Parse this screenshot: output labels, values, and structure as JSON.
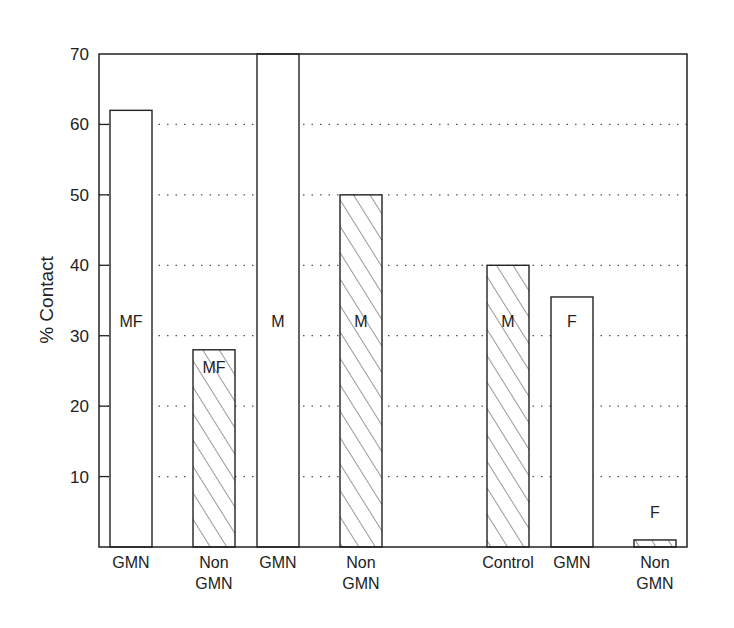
{
  "chart_data": {
    "type": "bar",
    "title": "",
    "xlabel": "",
    "ylabel": "% Contact",
    "ylim": [
      0,
      70
    ],
    "yticks": [
      10,
      20,
      30,
      40,
      50,
      60,
      70
    ],
    "grid": "horizontal dotted",
    "legend": "none (patterns: open = GMN, hatched = Non-GMN/Control; in-bar letters denote group)",
    "categories": [
      "GMN",
      "Non GMN",
      "GMN",
      "Non GMN",
      "Control",
      "GMN",
      "Non GMN"
    ],
    "values": [
      62,
      28,
      70,
      50,
      40,
      35.5,
      1
    ],
    "bars": [
      {
        "category": "GMN",
        "label": "MF",
        "value": 62,
        "pattern": "open"
      },
      {
        "category": "Non GMN",
        "label": "MF",
        "value": 28,
        "pattern": "hatched"
      },
      {
        "category": "GMN",
        "label": "M",
        "value": 70,
        "pattern": "open"
      },
      {
        "category": "Non GMN",
        "label": "M",
        "value": 50,
        "pattern": "hatched"
      },
      {
        "category": "Control",
        "label": "M",
        "value": 40,
        "pattern": "hatched"
      },
      {
        "category": "GMN",
        "label": "F",
        "value": 35.5,
        "pattern": "open"
      },
      {
        "category": "Non GMN",
        "label": "F",
        "value": 1,
        "pattern": "hatched"
      }
    ]
  },
  "axis": {
    "ylabel": "% Contact",
    "ytick_labels": [
      "10",
      "20",
      "30",
      "40",
      "50",
      "60",
      "70"
    ],
    "xtick_labels": [
      {
        "line1": "GMN",
        "line2": ""
      },
      {
        "line1": "Non",
        "line2": "GMN"
      },
      {
        "line1": "GMN",
        "line2": ""
      },
      {
        "line1": "Non",
        "line2": "GMN"
      },
      {
        "line1": "Control",
        "line2": ""
      },
      {
        "line1": "GMN",
        "line2": ""
      },
      {
        "line1": "Non",
        "line2": "GMN"
      }
    ]
  },
  "colors": {
    "ink": "#222222",
    "background": "#ffffff",
    "grid": "#555555"
  }
}
